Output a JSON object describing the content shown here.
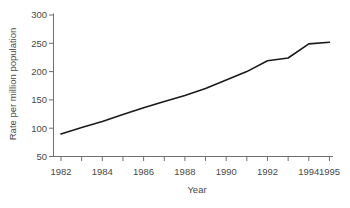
{
  "figure": {
    "background": "#ffffff"
  },
  "chart_data": {
    "type": "line",
    "title": "",
    "xlabel": "Year",
    "ylabel": "Rate per million population",
    "x": [
      1982,
      1983,
      1984,
      1985,
      1986,
      1987,
      1988,
      1989,
      1990,
      1991,
      1992,
      1993,
      1994,
      1995
    ],
    "series": [
      {
        "name": "Rate per million population",
        "values": [
          90,
          101,
          112,
          124,
          136,
          147,
          158,
          170,
          185,
          200,
          219,
          224,
          249,
          252
        ]
      }
    ],
    "xlim": [
      1982,
      1995
    ],
    "ylim": [
      50,
      300
    ],
    "y_ticks": [
      50,
      100,
      150,
      200,
      250,
      300
    ],
    "x_ticks": [
      1982,
      1983,
      1984,
      1985,
      1986,
      1987,
      1988,
      1989,
      1990,
      1991,
      1992,
      1993,
      1994,
      1995
    ],
    "x_tick_labels": [
      "1982",
      "1984",
      "1986",
      "1988",
      "1990",
      "1992",
      "1994",
      "1995"
    ],
    "grid": false,
    "legend": "none",
    "colors": {
      "line": "#1a1a1a",
      "axis": "#6f6f6f",
      "text": "#4a4a4a",
      "background": "#ffffff"
    }
  }
}
